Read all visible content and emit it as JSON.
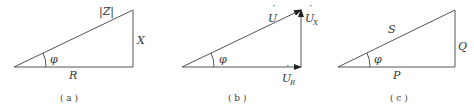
{
  "panels": [
    {
      "caption": "( a )",
      "hyp": "|Z|",
      "opp": "X",
      "adj": "R",
      "angle": "φ",
      "arrows": false
    },
    {
      "caption": "( b )",
      "hyp": "U",
      "opp": "U",
      "opp_sub": "X",
      "adj": "U",
      "adj_sub": "R",
      "angle": "φ",
      "arrows": true,
      "dot": "˙"
    },
    {
      "caption": "( c )",
      "hyp": "S",
      "opp": "Q",
      "adj": "P",
      "angle": "φ",
      "arrows": false
    }
  ]
}
